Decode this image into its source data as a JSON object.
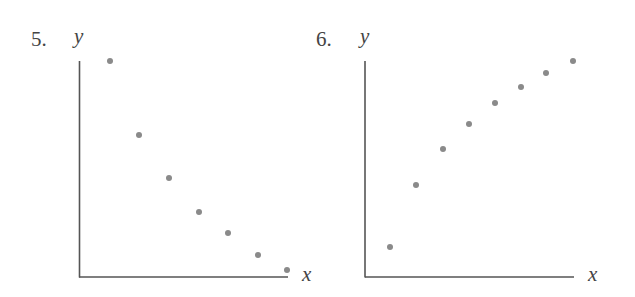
{
  "figures": [
    {
      "number": "5.",
      "y_label": "y",
      "x_label": "x"
    },
    {
      "number": "6.",
      "y_label": "y",
      "x_label": "x"
    }
  ],
  "colors": {
    "axis": "#555555",
    "point": "#8a8a8a",
    "text": "#444444"
  },
  "chart_data": [
    {
      "type": "scatter",
      "title": "5.",
      "xlabel": "x",
      "ylabel": "y",
      "grid": false,
      "legend": null,
      "ticks": "none",
      "trend": "decreasing, concave up (curving toward the x-axis)",
      "x": [
        1,
        2,
        3,
        4,
        5,
        6,
        7
      ],
      "y": [
        10,
        6.6,
        4.6,
        3.0,
        2.0,
        1.0,
        0.3
      ],
      "xlim": [
        0,
        7
      ],
      "ylim": [
        0,
        10
      ],
      "pixel_points": [
        [
          110,
          61
        ],
        [
          139,
          135
        ],
        [
          169,
          178
        ],
        [
          199,
          212
        ],
        [
          228,
          233
        ],
        [
          258,
          255
        ],
        [
          287,
          270
        ]
      ]
    },
    {
      "type": "scatter",
      "title": "6.",
      "xlabel": "x",
      "ylabel": "y",
      "grid": false,
      "legend": null,
      "ticks": "none",
      "trend": "increasing, concave down (leveling off)",
      "x": [
        1,
        2,
        3,
        4,
        5,
        6,
        7,
        8
      ],
      "y": [
        1.4,
        4.3,
        6.0,
        7.1,
        8.1,
        8.8,
        9.5,
        10
      ],
      "xlim": [
        0,
        8
      ],
      "ylim": [
        0,
        10
      ],
      "pixel_points": [
        [
          390,
          247
        ],
        [
          416,
          185
        ],
        [
          443,
          149
        ],
        [
          469,
          124
        ],
        [
          495,
          103
        ],
        [
          521,
          87
        ],
        [
          546,
          73
        ],
        [
          573,
          61
        ]
      ]
    }
  ]
}
